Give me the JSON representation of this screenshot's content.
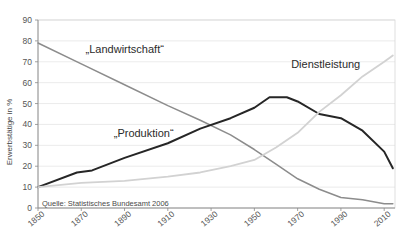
{
  "chart_data": {
    "type": "line",
    "title": "",
    "xlabel": "",
    "ylabel": "Erwerbstätige in %",
    "xlim": [
      1850,
      2015
    ],
    "ylim": [
      0,
      90
    ],
    "grid": true,
    "legend": "inline-labels",
    "x_ticks": [
      "1850",
      "1870",
      "1890",
      "1910",
      "1930",
      "1950",
      "1970",
      "1990",
      "2010"
    ],
    "y_ticks": [
      "0",
      "10",
      "20",
      "30",
      "40",
      "50",
      "60",
      "70",
      "80",
      "90"
    ],
    "source": "Quelle: Statistisches Bundesamt 2006",
    "series": [
      {
        "name": "„Landwirtschaft“",
        "color": "#8c8c8c",
        "label_x": 1872,
        "label_y": 74,
        "x": [
          1850,
          1870,
          1890,
          1910,
          1925,
          1939,
          1950,
          1960,
          1970,
          1980,
          1990,
          2000,
          2010,
          2014
        ],
        "values": [
          79,
          69,
          59,
          49,
          42,
          35,
          28,
          21,
          14,
          9,
          5,
          4,
          2,
          2
        ]
      },
      {
        "name": "„Produktion“",
        "color": "#262626",
        "label_x": 1885,
        "label_y": 34,
        "x": [
          1850,
          1868,
          1875,
          1890,
          1910,
          1925,
          1939,
          1950,
          1957,
          1965,
          1970,
          1980,
          1990,
          2000,
          2010,
          2014
        ],
        "values": [
          10,
          17,
          18,
          24,
          31,
          38,
          43,
          48,
          53,
          53,
          51,
          45,
          43,
          37,
          27,
          19
        ]
      },
      {
        "name": "Dienstleistung",
        "color": "#d2d2d2",
        "label_x": 1967,
        "label_y": 67,
        "x": [
          1850,
          1870,
          1890,
          1910,
          1925,
          1939,
          1950,
          1960,
          1970,
          1980,
          1990,
          2000,
          2010,
          2014
        ],
        "values": [
          10,
          12,
          13,
          15,
          17,
          20,
          23,
          29,
          36,
          46,
          54,
          63,
          70,
          73
        ]
      }
    ]
  },
  "axes": {
    "y_axis_title": "Erwerbstätige in %"
  }
}
